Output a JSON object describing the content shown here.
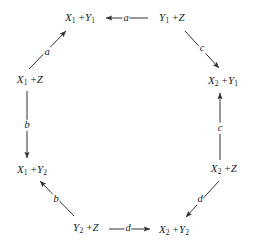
{
  "diagram": {
    "type": "commutative-diagram",
    "shape": "octagon",
    "stroke_color": "#333333",
    "text_color": "#1a1a1a",
    "background_color": "#ffffff",
    "nodes": [
      {
        "id": "x1y1",
        "label_html": "<i>X</i><sub>1</sub> +<i>Y</i><sub>1</sub>",
        "label_text": "X1 +Y1",
        "x": 80,
        "y": 18
      },
      {
        "id": "y1z",
        "label_html": "<i>Y</i><sub>1</sub> +<i>Z</i>",
        "label_text": "Y1 +Z",
        "x": 172,
        "y": 18
      },
      {
        "id": "x2y1",
        "label_html": "<i>X</i><sub>2</sub> +<i>Y</i><sub>1</sub>",
        "label_text": "X2 +Y1",
        "x": 223,
        "y": 81
      },
      {
        "id": "x2z",
        "label_html": "<i>X</i><sub>2</sub> +<i>Z</i>",
        "label_text": "X2 +Z",
        "x": 224,
        "y": 169
      },
      {
        "id": "x2y2",
        "label_html": "<i>X</i><sub>2</sub> +<i>Y</i><sub>2</sub>",
        "label_text": "X2 +Y2",
        "x": 174,
        "y": 230
      },
      {
        "id": "y2z",
        "label_html": "<i>Y</i><sub>2</sub> +<i>Z</i>",
        "label_text": "Y2 +Z",
        "x": 86,
        "y": 228
      },
      {
        "id": "x1y2",
        "label_html": "<i>X</i><sub>1</sub> +<i>Y</i><sub>2</sub>",
        "label_text": "X1 +Y2",
        "x": 32,
        "y": 170
      },
      {
        "id": "x1z",
        "label_html": "<i>X</i><sub>1</sub> +<i>Z</i>",
        "label_text": "X1 +Z",
        "x": 30,
        "y": 80
      }
    ],
    "edges": [
      {
        "id": "edge-a-top",
        "label": "a",
        "from": "y1z",
        "to": "x1y1",
        "label_x": 126,
        "label_y": 18,
        "direction": "left"
      },
      {
        "id": "edge-a-diagonal",
        "label": "a",
        "from": "x1z",
        "to": "x1y1",
        "label_x": 47,
        "label_y": 52,
        "direction": "up-right"
      },
      {
        "id": "edge-c-diagonal",
        "label": "c",
        "from": "y1z",
        "to": "x2y1",
        "label_x": 202,
        "label_y": 48,
        "direction": "down-right"
      },
      {
        "id": "edge-c-right",
        "label": "c",
        "from": "x2z",
        "to": "x2y1",
        "label_x": 220,
        "label_y": 128,
        "direction": "up"
      },
      {
        "id": "edge-b-left",
        "label": "b",
        "from": "x1z",
        "to": "x1y2",
        "label_x": 27,
        "label_y": 125,
        "direction": "down"
      },
      {
        "id": "edge-b-diagonal",
        "label": "b",
        "from": "y2z",
        "to": "x1y2",
        "label_x": 56,
        "label_y": 199,
        "direction": "up-left"
      },
      {
        "id": "edge-d-bottom",
        "label": "d",
        "from": "y2z",
        "to": "x2y2",
        "label_x": 128,
        "label_y": 228,
        "direction": "right"
      },
      {
        "id": "edge-d-diagonal",
        "label": "d",
        "from": "x2z",
        "to": "x2y2",
        "label_x": 200,
        "label_y": 199,
        "direction": "down-left"
      }
    ]
  }
}
